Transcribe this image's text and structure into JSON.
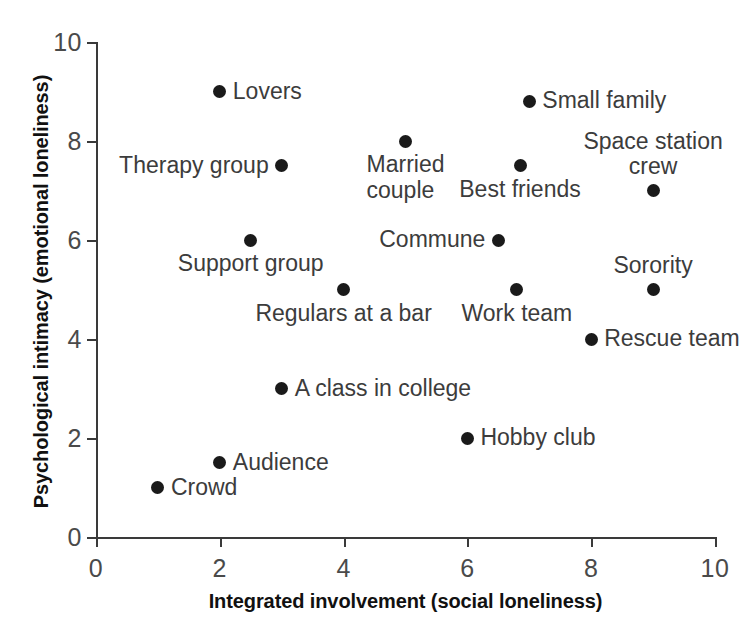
{
  "chart_data": {
    "type": "scatter",
    "title": "",
    "xlabel": "Integrated involvement (social loneliness)",
    "ylabel": "Psychological intimacy (emotional loneliness)",
    "xlim": [
      0,
      10
    ],
    "ylim": [
      0,
      10
    ],
    "xticks": [
      0,
      2,
      4,
      6,
      8,
      10
    ],
    "yticks": [
      0,
      2,
      4,
      6,
      8,
      10
    ],
    "xtick_labels": [
      "0",
      "2",
      "4",
      "6",
      "8",
      "10"
    ],
    "ytick_labels": [
      "0",
      "2",
      "4",
      "6",
      "8",
      "10"
    ],
    "grid": false,
    "legend": "none",
    "marker": "filled-circle",
    "marker_color": "#1a1a1a",
    "axis_color": "#3a3a3a",
    "points": [
      {
        "label": "Lovers",
        "x": 2,
        "y": 9,
        "label_pos": "right"
      },
      {
        "label": "Small family",
        "x": 7,
        "y": 8.8,
        "label_pos": "right"
      },
      {
        "label": "Married\ncouple",
        "x": 5,
        "y": 8,
        "label_pos": "below"
      },
      {
        "label": "Therapy group",
        "x": 3,
        "y": 7.5,
        "label_pos": "left"
      },
      {
        "label": "Best friends",
        "x": 6.85,
        "y": 7.5,
        "label_pos": "below"
      },
      {
        "label": "Space station\ncrew",
        "x": 9,
        "y": 7,
        "label_pos": "above"
      },
      {
        "label": "Support group",
        "x": 2.5,
        "y": 6,
        "label_pos": "below"
      },
      {
        "label": "Commune",
        "x": 6.5,
        "y": 6,
        "label_pos": "left"
      },
      {
        "label": "Regulars at a bar",
        "x": 4,
        "y": 5,
        "label_pos": "below"
      },
      {
        "label": "Work team",
        "x": 6.8,
        "y": 5,
        "label_pos": "below"
      },
      {
        "label": "Sorority",
        "x": 9,
        "y": 5,
        "label_pos": "above"
      },
      {
        "label": "Rescue team",
        "x": 8,
        "y": 4,
        "label_pos": "right"
      },
      {
        "label": "A class in college",
        "x": 3,
        "y": 3,
        "label_pos": "right"
      },
      {
        "label": "Hobby club",
        "x": 6,
        "y": 2,
        "label_pos": "right"
      },
      {
        "label": "Audience",
        "x": 2,
        "y": 1.5,
        "label_pos": "right"
      },
      {
        "label": "Crowd",
        "x": 1,
        "y": 1,
        "label_pos": "right"
      }
    ]
  }
}
